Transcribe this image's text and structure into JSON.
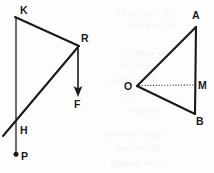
{
  "figure": {
    "background_color": "#fdfdfc",
    "stroke_color": "#1a1a1a",
    "left_figure": {
      "name": "force-diagram-KRHP",
      "labels": {
        "K": "K",
        "R": "R",
        "H": "H",
        "F": "F",
        "P": "P"
      },
      "points": {
        "K": [
          16,
          18
        ],
        "R": [
          78,
          46
        ],
        "H_cross": [
          16,
          127
        ],
        "diag_end": [
          3,
          136
        ],
        "F_tip": [
          78,
          96
        ],
        "P_end": [
          16,
          154
        ]
      }
    },
    "right_figure": {
      "name": "triangle-OAB",
      "labels": {
        "A": "A",
        "B": "B",
        "O": "O",
        "M": "M"
      },
      "points": {
        "A": [
          196,
          26
        ],
        "B": [
          195,
          114
        ],
        "O": [
          137,
          86
        ],
        "M": [
          195,
          85
        ]
      },
      "median_style": "dotted"
    },
    "ghost_text": [
      {
        "text": "the force to be",
        "x": 116,
        "y": 6
      },
      {
        "text": "of the given",
        "x": 128,
        "y": 18
      },
      {
        "text": "is equal to",
        "x": 122,
        "y": 46
      },
      {
        "text": "and in the",
        "x": 120,
        "y": 58
      },
      {
        "text": "the resultant",
        "x": 108,
        "y": 74
      },
      {
        "text": "two forces",
        "x": 118,
        "y": 88
      },
      {
        "text": "acting at",
        "x": 126,
        "y": 104
      },
      {
        "text": "is equal to twice",
        "x": 104,
        "y": 128
      },
      {
        "text": "the median",
        "x": 116,
        "y": 142
      },
      {
        "text": "of the triangle",
        "x": 110,
        "y": 156
      }
    ]
  }
}
